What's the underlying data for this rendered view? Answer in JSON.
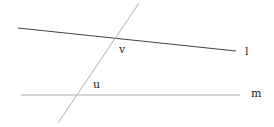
{
  "diagram": {
    "type": "geometry-parallel-lines-transversal",
    "lines": [
      {
        "id": "l",
        "label": "l",
        "x1": 18,
        "y1": 28,
        "x2": 236,
        "y2": 51,
        "color": "#444444",
        "width": 1.2
      },
      {
        "id": "m",
        "label": "m",
        "x1": 21,
        "y1": 95,
        "x2": 240,
        "y2": 95,
        "color": "#aaaaaa",
        "width": 1
      },
      {
        "id": "transversal",
        "label": "",
        "x1": 139,
        "y1": 3,
        "x2": 58,
        "y2": 123,
        "color": "#b0b0b0",
        "width": 1
      }
    ],
    "labels": {
      "l": "l",
      "m": "m",
      "v": "v",
      "u": "u"
    },
    "points": [
      {
        "id": "v",
        "label": "v",
        "x": 116,
        "y": 39
      },
      {
        "id": "u",
        "label": "u",
        "x": 76,
        "y": 95
      }
    ]
  }
}
